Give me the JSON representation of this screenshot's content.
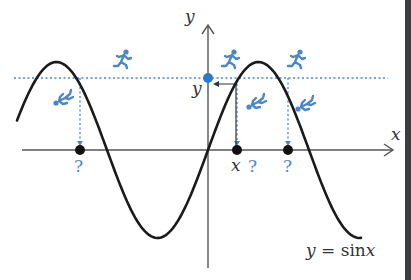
{
  "figure": {
    "type": "inverse-sine-illustration",
    "equation_label": {
      "lhs": "y",
      "eq": "=",
      "fn": "sin",
      "var": "x"
    },
    "axes": {
      "x_label": "x",
      "y_label": "y",
      "origin_px": [
        208,
        150
      ]
    },
    "given_value_label": "y",
    "marked_x_label": "x",
    "question_marks": [
      "?",
      "?",
      "?"
    ],
    "colors": {
      "curve": "#1a1a1a",
      "axis": "#555555",
      "accent_blue": "#4a86c8",
      "dot_blue": "#2f78c9",
      "point": "#111111",
      "edge_bar": "#3c3c3c"
    },
    "runners": [
      {
        "pose": "running",
        "x": 117,
        "y": 50
      },
      {
        "pose": "running",
        "x": 224,
        "y": 50
      },
      {
        "pose": "running",
        "x": 290,
        "y": 50
      },
      {
        "pose": "falling",
        "x": 52,
        "y": 88
      },
      {
        "pose": "falling",
        "x": 244,
        "y": 90
      },
      {
        "pose": "falling",
        "x": 293,
        "y": 92
      }
    ],
    "intersection_points_x_px": [
      80,
      237,
      288
    ]
  }
}
